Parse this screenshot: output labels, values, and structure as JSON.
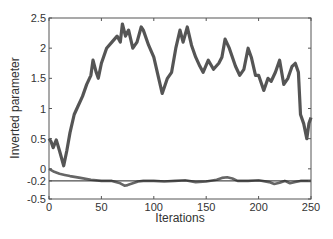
{
  "chart_data": {
    "type": "line",
    "title": "",
    "xlabel": "Iterations",
    "ylabel": "Inverted parameter",
    "xlim": [
      0,
      250
    ],
    "ylim": [
      -0.5,
      2.5
    ],
    "x_ticks": [
      0,
      50,
      100,
      150,
      200,
      250
    ],
    "y_ticks": [
      -0.5,
      -0.2,
      0,
      0.5,
      1,
      1.5,
      2,
      2.5
    ],
    "y_tick_labels": [
      "-0.5",
      "-0.2",
      "0",
      "0.5",
      "1",
      "1.5",
      "2",
      "2.5"
    ],
    "grid": false,
    "legend": null,
    "reference_line": {
      "y": -0.2,
      "color": "#222222"
    },
    "series": [
      {
        "name": "upper",
        "color": "#555555",
        "x": [
          0,
          2,
          4,
          7,
          10,
          14,
          17,
          20,
          24,
          28,
          32,
          36,
          40,
          42,
          45,
          47,
          50,
          55,
          60,
          65,
          68,
          70,
          73,
          76,
          80,
          84,
          88,
          90,
          95,
          100,
          104,
          108,
          113,
          117,
          121,
          125,
          128,
          132,
          136,
          140,
          144,
          147,
          152,
          157,
          162,
          165,
          168,
          172,
          178,
          182,
          186,
          190,
          193,
          197,
          200,
          205,
          209,
          212,
          216,
          220,
          224,
          228,
          232,
          235,
          238,
          240,
          243,
          246,
          248,
          250
        ],
        "y": [
          0.5,
          0.45,
          0.35,
          0.48,
          0.3,
          0.05,
          0.3,
          0.6,
          0.9,
          1.05,
          1.2,
          1.4,
          1.55,
          1.8,
          1.6,
          1.5,
          1.75,
          2.0,
          2.1,
          2.2,
          2.1,
          2.4,
          2.2,
          2.3,
          2.0,
          2.1,
          2.35,
          2.3,
          2.05,
          1.85,
          1.55,
          1.25,
          1.5,
          1.6,
          2.0,
          2.3,
          2.1,
          2.35,
          2.05,
          1.85,
          1.7,
          1.6,
          1.8,
          1.65,
          1.75,
          1.85,
          2.15,
          2.0,
          1.7,
          1.55,
          1.65,
          2.0,
          1.85,
          1.55,
          1.55,
          1.3,
          1.5,
          1.45,
          1.6,
          1.8,
          1.4,
          1.5,
          1.7,
          1.75,
          1.6,
          0.9,
          0.75,
          0.5,
          0.75,
          0.85
        ]
      },
      {
        "name": "lower",
        "color": "#666666",
        "x": [
          0,
          5,
          10,
          15,
          20,
          30,
          40,
          50,
          60,
          68,
          72,
          75,
          80,
          85,
          90,
          100,
          110,
          120,
          130,
          140,
          150,
          160,
          165,
          170,
          175,
          180,
          190,
          200,
          210,
          215,
          220,
          225,
          230,
          235,
          240,
          250
        ],
        "y": [
          0.0,
          -0.05,
          -0.08,
          -0.1,
          -0.12,
          -0.15,
          -0.18,
          -0.2,
          -0.2,
          -0.24,
          -0.28,
          -0.27,
          -0.24,
          -0.21,
          -0.2,
          -0.2,
          -0.21,
          -0.2,
          -0.19,
          -0.22,
          -0.21,
          -0.18,
          -0.15,
          -0.14,
          -0.16,
          -0.2,
          -0.2,
          -0.19,
          -0.22,
          -0.25,
          -0.23,
          -0.2,
          -0.24,
          -0.22,
          -0.2,
          -0.2
        ]
      }
    ]
  },
  "axes": {
    "xlabel": "Iterations",
    "ylabel": "Inverted parameter"
  }
}
